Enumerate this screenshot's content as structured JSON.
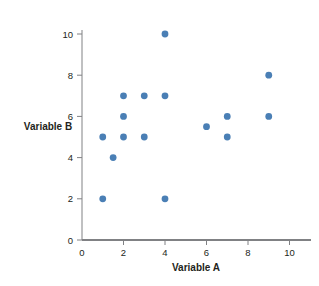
{
  "chart_data": {
    "type": "scatter",
    "title": "",
    "xlabel": "Variable A",
    "ylabel": "Variable B",
    "xlim": [
      0,
      11
    ],
    "ylim": [
      0,
      10.8
    ],
    "xticks": [
      0,
      2,
      4,
      6,
      8,
      10
    ],
    "yticks": [
      0,
      2,
      4,
      6,
      8,
      10
    ],
    "xtick_labels": [
      "0",
      "2",
      "4",
      "6",
      "8",
      "10"
    ],
    "ytick_labels": [
      "0",
      "2",
      "4",
      "6",
      "8",
      "10"
    ],
    "grid": false,
    "legend": null,
    "marker_color": "#4a7fb5",
    "axis_color": "#808184",
    "series": [
      {
        "name": "data",
        "points": [
          {
            "x": 1,
            "y": 2
          },
          {
            "x": 1,
            "y": 5
          },
          {
            "x": 1.5,
            "y": 4
          },
          {
            "x": 2,
            "y": 5
          },
          {
            "x": 2,
            "y": 6
          },
          {
            "x": 2,
            "y": 7
          },
          {
            "x": 3,
            "y": 5
          },
          {
            "x": 3,
            "y": 7
          },
          {
            "x": 4,
            "y": 2
          },
          {
            "x": 4,
            "y": 7
          },
          {
            "x": 4,
            "y": 10
          },
          {
            "x": 6,
            "y": 5.5
          },
          {
            "x": 7,
            "y": 5
          },
          {
            "x": 7,
            "y": 6
          },
          {
            "x": 9,
            "y": 6
          },
          {
            "x": 9,
            "y": 8
          }
        ]
      }
    ]
  },
  "labels": {
    "y_axis_title": "Variable B",
    "x_axis_title": "Variable A"
  }
}
